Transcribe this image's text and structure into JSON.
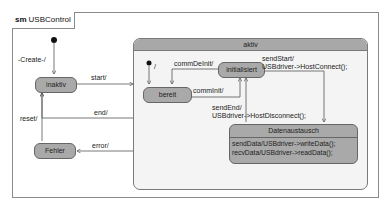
{
  "diagram": {
    "type": "UML state machine",
    "frame": {
      "keyword": "sm",
      "name": "USBControl"
    },
    "composite_state": {
      "name": "aktiv"
    },
    "states": [
      {
        "id": "inaktiv",
        "label": "inaktiv"
      },
      {
        "id": "fehler",
        "label": "Fehler"
      },
      {
        "id": "bereit",
        "label": "bereit"
      },
      {
        "id": "initialisiert",
        "label": "initialisiert"
      },
      {
        "id": "datenaustausch",
        "label": "Datenaustausch",
        "internal": [
          "sendData/USBdriver->writeData();",
          "recvData/USBdriver->readData();"
        ]
      }
    ],
    "transitions": [
      {
        "from": "initial",
        "to": "inaktiv",
        "label": "-Create-/"
      },
      {
        "from": "inaktiv",
        "to": "aktiv",
        "label": "start/"
      },
      {
        "from": "aktiv",
        "to": "inaktiv",
        "label": "end/"
      },
      {
        "from": "aktiv",
        "to": "fehler",
        "label": "error/"
      },
      {
        "from": "fehler",
        "to": "inaktiv",
        "label": "reset/"
      },
      {
        "from": "initial-inner",
        "to": "bereit",
        "label": "/"
      },
      {
        "from": "initialisiert",
        "to": "bereit",
        "label": "commDeInit/"
      },
      {
        "from": "bereit",
        "to": "initialisiert",
        "label": "commInit/"
      },
      {
        "from": "initialisiert",
        "to": "datenaustausch",
        "label": "sendStart/",
        "label2": "USBdriver->HostConnect();"
      },
      {
        "from": "datenaustausch",
        "to": "initialisiert",
        "label": "sendEnd/",
        "label2": "USBdriver->HostDisconnect();"
      }
    ]
  },
  "colors": {
    "state_fill": "#a9a9a9",
    "composite_fill": "#f4f4f4",
    "composite_header": "#a8a8a8",
    "line": "#555555"
  }
}
